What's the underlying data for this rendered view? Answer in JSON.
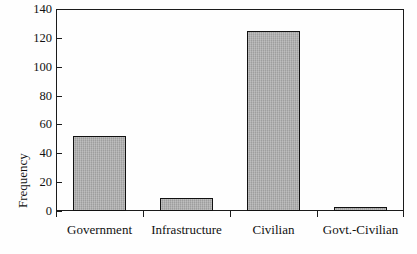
{
  "figure": {
    "ylabel": "Frequency",
    "cropped_title": "",
    "bar_fill_color": "#a9a9a9",
    "bar_edge_color": "#111111",
    "axis_color": "#1b1b1b",
    "background_color": "#fefefe"
  },
  "chart_data": {
    "type": "bar",
    "title": "",
    "xlabel": "",
    "ylabel": "Frequency",
    "categories": [
      "Government",
      "Infrastructure",
      "Civilian",
      "Govt.-Civilian"
    ],
    "values": [
      52,
      9,
      125,
      3
    ],
    "ylim": [
      0,
      140
    ],
    "yticks": [
      0,
      20,
      40,
      60,
      80,
      100,
      120,
      140
    ],
    "ytick_labels": [
      "0",
      "20",
      "40",
      "60",
      "80",
      "100",
      "120",
      "140"
    ],
    "grid": false,
    "legend": null,
    "series": [
      {
        "name": "Frequency",
        "values": [
          52,
          9,
          125,
          3
        ]
      }
    ]
  }
}
